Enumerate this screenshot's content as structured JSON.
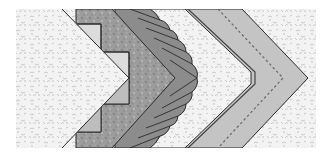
{
  "diagram": {
    "layers": [
      {
        "name": "background-print",
        "fill": "#f1f1f1",
        "pattern": "light-floral"
      },
      {
        "name": "center-white-chevron",
        "fill": "#f4f4f4",
        "pattern": "light-floral"
      },
      {
        "name": "stepped-squares-light",
        "fill": "#dcdcdc"
      },
      {
        "name": "stepped-squares-mid",
        "fill": "#bdbdbd"
      },
      {
        "name": "dark-print-band",
        "fill": "#9a9a9a",
        "pattern": "dark-speckle"
      },
      {
        "name": "ruffle",
        "fill": "#8c8c8c"
      },
      {
        "name": "light-print-band",
        "fill": "#f2f2f2",
        "pattern": "light-floral"
      },
      {
        "name": "piping",
        "stroke": "#444444"
      },
      {
        "name": "outer-border",
        "fill": "#c4c4c4",
        "stitch": "dashed"
      }
    ],
    "colors": {
      "outline": "#2a2a2a",
      "stitch": "#666666"
    }
  }
}
